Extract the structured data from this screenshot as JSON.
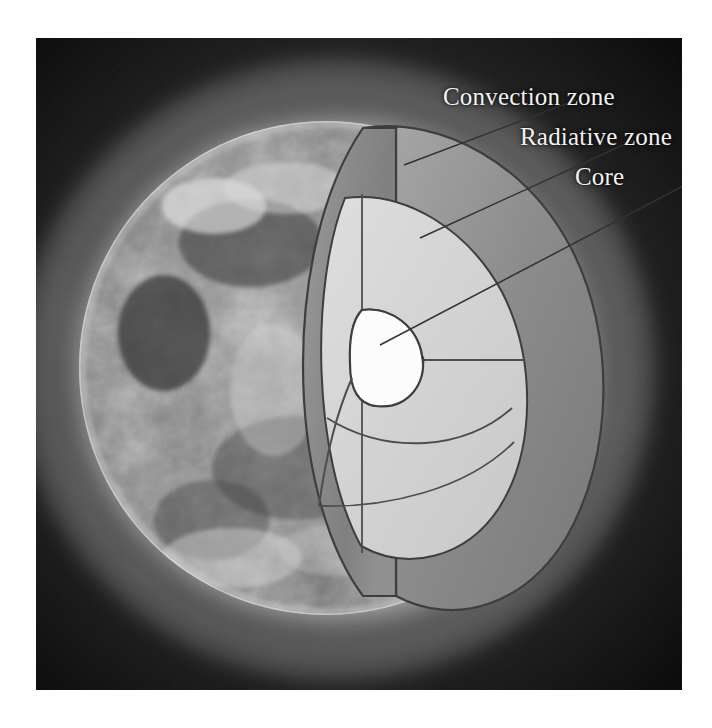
{
  "figure": {
    "photo_description": "Grayscale photograph of the Sun with bright corona and mottled surface",
    "border_color": "#ffffff",
    "background_color": "#0b0b0b"
  },
  "labels": {
    "convection": "Convection zone",
    "radiative": "Radiative zone",
    "core": "Core"
  },
  "colors": {
    "label_text": "#f2f2f2",
    "convection_fill": "#8e8e8e",
    "radiative_fill": "#d6d6d6",
    "core_fill": "#ffffff",
    "outline": "#3a3a3a",
    "leader_line": "#333333",
    "corona_glow": "#e8e8e8",
    "disk_dark": "#6a6a6a"
  },
  "structure": {
    "layers": [
      {
        "name": "Convection zone",
        "order": 1,
        "position": "outer shell",
        "fill": "#8e8e8e"
      },
      {
        "name": "Radiative zone",
        "order": 2,
        "position": "middle shell",
        "fill": "#d6d6d6"
      },
      {
        "name": "Core",
        "order": 3,
        "position": "center",
        "fill": "#ffffff"
      }
    ]
  },
  "leaders": {
    "convection": {
      "from": [
        545,
        62
      ],
      "to": [
        404,
        165
      ]
    },
    "radiative": {
      "from": [
        600,
        102
      ],
      "to": [
        420,
        238
      ]
    },
    "core": {
      "from": [
        660,
        142
      ],
      "to": [
        380,
        345
      ]
    }
  }
}
